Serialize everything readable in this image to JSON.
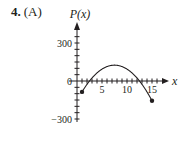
{
  "problem": {
    "number": "4.",
    "part": "(A)"
  },
  "chart_data": {
    "type": "line",
    "title": "",
    "xlabel": "x",
    "ylabel": "P(x)",
    "x_ticks": [
      5,
      10,
      15
    ],
    "y_ticks": [
      300,
      0,
      -300
    ],
    "x_tick_labels": [
      "5",
      "10",
      "15"
    ],
    "y_tick_labels": [
      "300",
      "0",
      "−300"
    ],
    "xlim": [
      0,
      17
    ],
    "ylim": [
      -300,
      400
    ],
    "grid": false,
    "x_minor_tick_step": 1,
    "y_minor_tick_step": 50,
    "function": "P(x) = -5(x - 2.5)(x - 12.5)",
    "domain": [
      1,
      15
    ],
    "endpoints": [
      {
        "x": 1,
        "y": -86,
        "marker": "filled-dot"
      },
      {
        "x": 15,
        "y": -156,
        "marker": "filled-dot"
      }
    ],
    "series": [
      {
        "name": "P(x)",
        "x": [
          1,
          2,
          2.5,
          3,
          4,
          5,
          6,
          7,
          7.5,
          8,
          9,
          10,
          11,
          12,
          12.5,
          13,
          14,
          15
        ],
        "values": [
          -86,
          -26,
          0,
          24,
          64,
          94,
          114,
          124,
          125,
          124,
          114,
          94,
          64,
          24,
          0,
          -26,
          -86,
          -156
        ]
      }
    ],
    "zeros": [
      2.5,
      12.5
    ],
    "maximum": {
      "x": 7.5,
      "y": 125
    }
  }
}
